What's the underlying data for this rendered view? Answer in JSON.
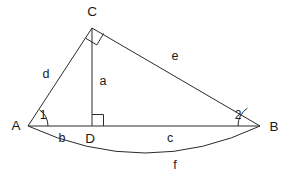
{
  "figure": {
    "stroke_color": "#2b2b2b",
    "text_color": "#1a1a1a",
    "background_color": "#ffffff",
    "width": 293,
    "height": 179
  },
  "vertices": [
    {
      "id": "A",
      "label": "A",
      "x": 28,
      "y": 126,
      "label_x": 16,
      "label_y": 126
    },
    {
      "id": "B",
      "label": "B",
      "x": 260,
      "y": 126,
      "label_x": 274,
      "label_y": 127
    },
    {
      "id": "C",
      "label": "C",
      "x": 92,
      "y": 28,
      "label_x": 92,
      "label_y": 12
    },
    {
      "id": "D",
      "label": "D",
      "x": 92,
      "y": 126,
      "label_x": 90,
      "label_y": 139
    }
  ],
  "segments": [
    {
      "id": "AC",
      "label": "d",
      "from": "A",
      "to": "C",
      "label_x": 46,
      "label_y": 75
    },
    {
      "id": "CB",
      "label": "e",
      "from": "C",
      "to": "B",
      "label_x": 175,
      "label_y": 57
    },
    {
      "id": "CD",
      "label": "a",
      "from": "C",
      "to": "D",
      "label_x": 103,
      "label_y": 82
    },
    {
      "id": "AD",
      "label": "b",
      "from": "A",
      "to": "D",
      "label_x": 62,
      "label_y": 139
    },
    {
      "id": "DB",
      "label": "c",
      "from": "D",
      "to": "B",
      "label_x": 170,
      "label_y": 139
    },
    {
      "id": "AB_arc",
      "label": "f",
      "from": "A",
      "to": "B",
      "label_x": 175,
      "label_y": 166
    }
  ],
  "angles": [
    {
      "id": "angle-1",
      "label": "1",
      "at": "A",
      "label_x": 43,
      "label_y": 116
    },
    {
      "id": "angle-2",
      "label": "2",
      "at": "B",
      "label_x": 238,
      "label_y": 116
    }
  ],
  "right_angles": [
    {
      "id": "right-angle-C",
      "at": "C",
      "note": "angle ACB"
    },
    {
      "id": "right-angle-D",
      "at": "D",
      "note": "angle CDB"
    }
  ],
  "arc": {
    "id": "arc-f",
    "label": "f",
    "from_x": 28,
    "from_y": 126,
    "to_x": 260,
    "to_y": 126,
    "control_x": 146,
    "control_y": 180
  }
}
